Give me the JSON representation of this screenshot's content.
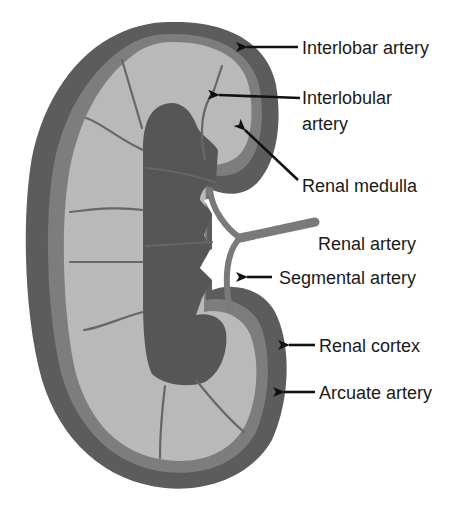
{
  "diagram": {
    "colors": {
      "background": "#ffffff",
      "renal_cortex": "#5c5c5c",
      "arcuate_band": "#7d7d7d",
      "renal_medulla": "#b9b9b9",
      "renal_sinus": "#565656",
      "vessel": "#7a7a7a",
      "arrow": "#111111",
      "label_text": "#1a1a1a"
    },
    "labels": [
      {
        "id": "interlobar",
        "line1": "Interlobar artery",
        "line2": ""
      },
      {
        "id": "interlobular",
        "line1": "Interlobular",
        "line2": "artery"
      },
      {
        "id": "medulla",
        "line1": "Renal medulla",
        "line2": ""
      },
      {
        "id": "renal-artery",
        "line1": "Renal artery",
        "line2": ""
      },
      {
        "id": "segmental",
        "line1": "Segmental artery",
        "line2": ""
      },
      {
        "id": "cortex",
        "line1": "Renal cortex",
        "line2": ""
      },
      {
        "id": "arcuate",
        "line1": "Arcuate artery",
        "line2": ""
      }
    ]
  }
}
